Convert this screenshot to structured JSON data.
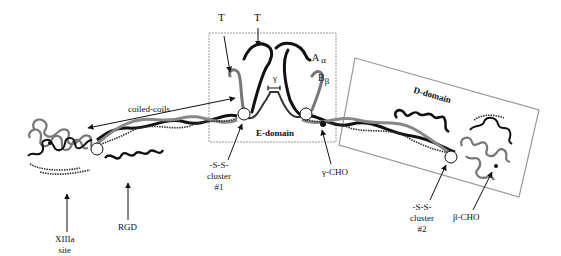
{
  "diagram": {
    "type": "protein-structure",
    "labels": {
      "t_left": "T",
      "t_center": "T",
      "a_alpha_main": "A",
      "a_alpha_sub": "α",
      "b_beta_main": "B",
      "b_beta_sub": "β",
      "gamma": "γ",
      "coiled_coils": "coiled-coils",
      "e_domain": "E-domain",
      "d_domain": "D-domain",
      "ss_cluster_1": [
        "-S-S-",
        "cluster",
        "#1"
      ],
      "ss_cluster_2": [
        "-S-S-",
        "cluster",
        "#2"
      ],
      "gamma_cho": "γ-CHO",
      "beta_cho": "β-CHO",
      "rgd": "RGD",
      "xiiia_site": [
        "XIIIa",
        "site"
      ]
    },
    "colors": {
      "alpha_chain": "#111111",
      "beta_chain": "#777777",
      "gamma_chain": "#333333",
      "box_border": "#999999",
      "text": "#111111"
    }
  }
}
